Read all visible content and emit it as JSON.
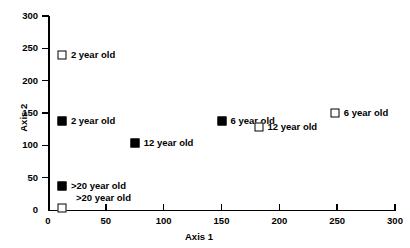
{
  "chart_data": {
    "type": "scatter",
    "title": "",
    "xlabel": "Axis 1",
    "ylabel": "Axis 2",
    "xlim": [
      0,
      300
    ],
    "ylim": [
      0,
      300
    ],
    "xticks": [
      0,
      50,
      100,
      150,
      200,
      250,
      300
    ],
    "yticks": [
      0,
      50,
      100,
      150,
      200,
      250,
      300
    ],
    "grid": false,
    "legend": "none",
    "points": [
      {
        "label": "2 year old",
        "x": 12,
        "y": 240,
        "marker": "open-square",
        "label_dx": 9,
        "label_dy": 0
      },
      {
        "label": "2 year old",
        "x": 12,
        "y": 137,
        "marker": "filled-square",
        "label_dx": 9,
        "label_dy": 0
      },
      {
        "label": "12 year old",
        "x": 75,
        "y": 103,
        "marker": "filled-square",
        "label_dx": 9,
        "label_dy": 0
      },
      {
        "label": "6 year old",
        "x": 150,
        "y": 138,
        "marker": "filled-square",
        "label_dx": 9,
        "label_dy": 0
      },
      {
        "label": "12 year old",
        "x": 182,
        "y": 128,
        "marker": "open-square",
        "label_dx": 9,
        "label_dy": 0
      },
      {
        "label": "6 year old",
        "x": 248,
        "y": 150,
        "marker": "open-square",
        "label_dx": 9,
        "label_dy": 0
      },
      {
        "label": ">20 year old",
        "x": 12,
        "y": 37,
        "marker": "filled-square",
        "label_dx": 9,
        "label_dy": 0
      },
      {
        "label": ">20 year old",
        "x": 12,
        "y": 3,
        "marker": "open-square",
        "label_dx": 14,
        "label_dy": -10
      }
    ]
  },
  "axes": {
    "x": {
      "title": "Axis 1",
      "tick_labels": [
        "0",
        "50",
        "100",
        "150",
        "200",
        "250",
        "300"
      ]
    },
    "y": {
      "title": "Axis 2",
      "tick_labels": [
        "0",
        "50",
        "100",
        "150",
        "200",
        "250",
        "300"
      ]
    }
  },
  "colors": {
    "axis": "#000000",
    "marker_fill": "#000000",
    "marker_open_fill": "#ffffff",
    "background": "#ffffff"
  }
}
